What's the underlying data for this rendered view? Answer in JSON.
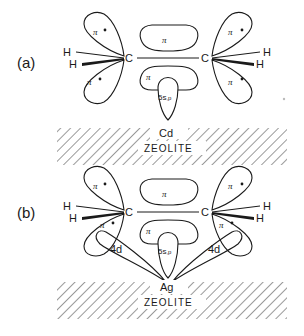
{
  "figure": {
    "panels": [
      {
        "label": "(a)",
        "metal": "Cd",
        "substrate": "ZEOLITE",
        "atoms": [
          "C",
          "C",
          "H",
          "H",
          "H",
          "H"
        ],
        "orbitals": {
          "pi": "π",
          "pi_star": "π*",
          "metal_sp": "5s,p"
        }
      },
      {
        "label": "(b)",
        "metal": "Ag",
        "substrate": "ZEOLITE",
        "atoms": [
          "C",
          "C",
          "H",
          "H",
          "H",
          "H"
        ],
        "orbitals": {
          "pi": "π",
          "pi_star": "π*",
          "metal_sp": "5s,p",
          "metal_d": "4d"
        }
      }
    ],
    "symbols": {
      "C": "C",
      "H": "H",
      "pi": "π",
      "pi_star": "π",
      "star": "•",
      "sp_main": "5s",
      "sp_sub": ",p",
      "d": "4d"
    }
  }
}
